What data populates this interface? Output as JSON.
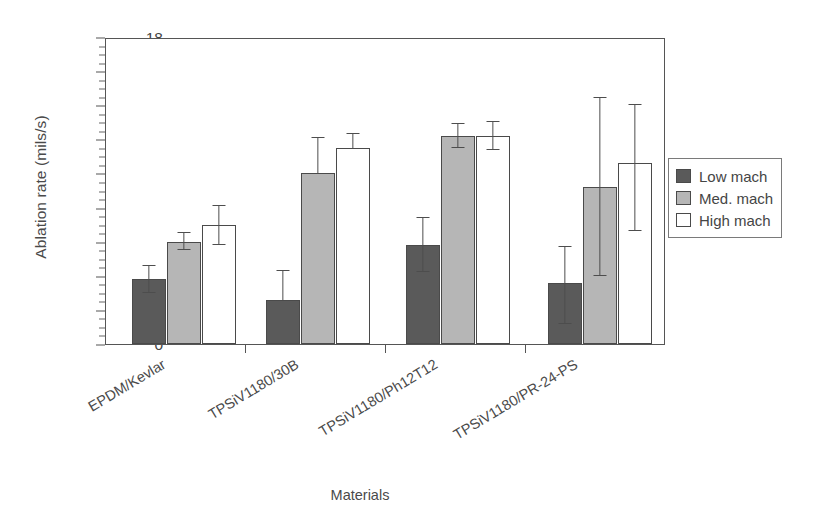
{
  "chart_data": {
    "type": "bar",
    "title": "",
    "xlabel": "Materials",
    "ylabel": "Ablation rate (mils/s)",
    "ylim": [
      0,
      18
    ],
    "grid": false,
    "legend_position": "right",
    "categories": [
      "EPDM/Kevlar",
      "TPSiV1180/30B",
      "TPSiV1180/Ph12T12",
      "TPSiV1180/PR-24-PS"
    ],
    "ytick_labels": [
      "18",
      "16",
      "12",
      "14",
      "10",
      "8",
      "6",
      "4",
      "2",
      "0"
    ],
    "ytick_positions": [
      18,
      16,
      14,
      12,
      10,
      8,
      6,
      4,
      2,
      0
    ],
    "minor_tick_step": 0.5,
    "series": [
      {
        "name": "Low mach",
        "color": "#5a5a5a",
        "values": [
          3.8,
          2.6,
          5.8,
          3.6
        ],
        "err_upper": [
          0.8,
          1.7,
          1.6,
          2.1
        ],
        "err_lower": [
          0.8,
          0.0,
          1.6,
          2.4
        ]
      },
      {
        "name": "Med. mach",
        "color": "#b6b6b6",
        "values": [
          6.0,
          10.0,
          12.2,
          9.2
        ],
        "err_upper": [
          0.5,
          2.1,
          0.7,
          5.2
        ],
        "err_lower": [
          0.5,
          0.0,
          0.7,
          5.2
        ]
      },
      {
        "name": "High mach",
        "color": "#ffffff",
        "values": [
          7.0,
          11.5,
          12.2,
          10.6
        ],
        "err_upper": [
          1.1,
          0.8,
          0.8,
          3.4
        ],
        "err_lower": [
          1.2,
          0.0,
          0.8,
          4.0
        ]
      }
    ]
  },
  "legend": {
    "items": [
      {
        "label": "Low mach",
        "color": "#5a5a5a"
      },
      {
        "label": "Med. mach",
        "color": "#b6b6b6"
      },
      {
        "label": "High mach",
        "color": "#ffffff"
      }
    ]
  },
  "axes": {
    "y_title": "Ablation rate (mils/s)",
    "x_title": "Materials"
  }
}
